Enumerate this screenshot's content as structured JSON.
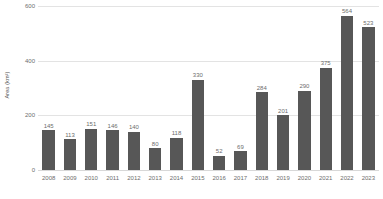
{
  "chart_data": {
    "type": "bar",
    "title": "",
    "subtitle": "",
    "xlabel": "",
    "ylabel": "Area (km²)",
    "categories": [
      "2008",
      "2009",
      "2010",
      "2011",
      "2012",
      "2013",
      "2014",
      "2015",
      "2016",
      "2017",
      "2018",
      "2019",
      "2020",
      "2021",
      "2022",
      "2023"
    ],
    "values": [
      145,
      113,
      151,
      146,
      140,
      80,
      118,
      330,
      52,
      69,
      284,
      201,
      290,
      375,
      564,
      523
    ],
    "value_labels": [
      "145",
      "113",
      "151",
      "146",
      "140",
      "80",
      "118",
      "330",
      "52",
      "69",
      "284",
      "201",
      "290",
      "375",
      "564",
      "523"
    ],
    "ylim": [
      0,
      600
    ],
    "yticks": [
      0,
      200,
      400,
      600
    ],
    "ytick_labels": [
      "0",
      "200",
      "400",
      "600"
    ],
    "grid": true,
    "grid_axis": "y",
    "legend": false,
    "legend_position": "none",
    "series": [
      {
        "name": "Area",
        "values": [
          145,
          113,
          151,
          146,
          140,
          80,
          118,
          330,
          52,
          69,
          284,
          201,
          290,
          375,
          564,
          523
        ]
      }
    ],
    "colors": {
      "bar": "#575757",
      "gridline": "#e3e3e3",
      "axis_line": "#d8d8d8",
      "tick_label": "#6d6d6d",
      "value_label": "#6d6d6d",
      "axis_title": "#555555",
      "background": "#ffffff"
    }
  }
}
